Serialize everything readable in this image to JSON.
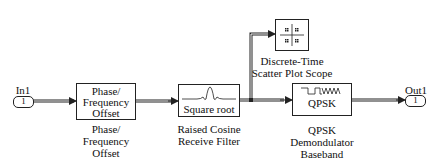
{
  "ports": {
    "in1": {
      "label": "In1",
      "number": "1"
    },
    "out1": {
      "label": "Out1",
      "number": "1"
    }
  },
  "blocks": {
    "phase_offset": {
      "text_lines": [
        "Phase/",
        "Frequency",
        "Offset"
      ],
      "caption_lines": [
        "Phase/",
        "Frequency",
        "Offset"
      ]
    },
    "rrc_filter": {
      "text": "Square root",
      "caption_lines": [
        "Raised Cosine",
        "Receive Filter"
      ]
    },
    "scope": {
      "caption_lines": [
        "Discrete-Time",
        "Scatter Plot Scope"
      ]
    },
    "qpsk_demod": {
      "text": "QPSK",
      "caption_lines": [
        "QPSK",
        "Demondulator",
        "Baseband"
      ]
    }
  },
  "colors": {
    "line": "#222222",
    "background": "#ffffff"
  }
}
